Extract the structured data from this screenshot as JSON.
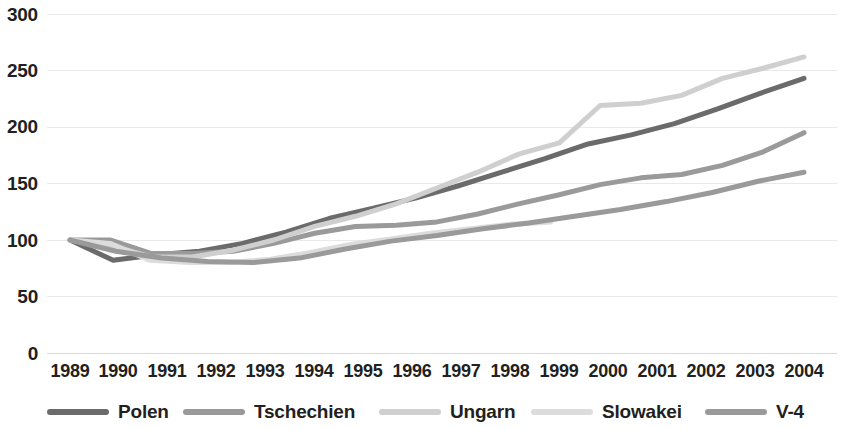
{
  "chart_data": {
    "type": "line",
    "title": "",
    "subtitle": "",
    "xlabel": "",
    "ylabel": "",
    "grid": true,
    "legend_position": "bottom",
    "categories": [
      "1989",
      "1990",
      "1991",
      "1992",
      "1993",
      "1994",
      "1995",
      "1996",
      "1997",
      "1998",
      "1999",
      "2000",
      "2001",
      "2002",
      "2003",
      "2004"
    ],
    "x": [
      1989,
      1990,
      1991,
      1992,
      1993,
      1994,
      1995,
      1996,
      1997,
      1998,
      1999,
      2000,
      2001,
      2002,
      2003,
      2004
    ],
    "ylim": [
      0,
      300
    ],
    "xlim": [
      1989,
      2004
    ],
    "yticks": [
      0,
      50,
      100,
      150,
      200,
      250,
      300
    ],
    "series": [
      {
        "name": "Polen",
        "color": "#595959",
        "values": [
          100,
          82,
          86,
          90,
          94,
          99,
          106,
          113,
          121,
          127,
          133,
          140,
          142,
          144,
          150,
          158
        ]
      },
      {
        "name": "Tschechien",
        "color": "#8c8c8c",
        "values": [
          100,
          99,
          88,
          88,
          88,
          91,
          97,
          101,
          100,
          99,
          100,
          104,
          107,
          109,
          113,
          118
        ]
      },
      {
        "name": "Ungarn",
        "color": "#c9c9c9",
        "values": [
          100,
          96,
          85,
          82,
          82,
          85,
          87,
          88,
          92,
          97,
          102,
          108,
          113,
          118,
          123,
          128
        ]
      },
      {
        "name": "Slowakei",
        "color": "#d8d8d8",
        "values": [
          100,
          97,
          82,
          80,
          80,
          84,
          89,
          95,
          101,
          105,
          108,
          111,
          116,
          119,
          124,
          130
        ]
      },
      {
        "name": "V-4",
        "color": "#a6a6a6",
        "values": [
          100,
          92,
          86,
          87,
          88,
          91,
          96,
          101,
          105,
          108,
          112,
          116,
          120,
          124,
          129,
          135
        ]
      }
    ],
    "plot_series": [
      {
        "name": "Polen",
        "color": "#6b6b6b",
        "width": 5,
        "values": [
          100,
          82,
          87,
          90,
          97,
          107,
          119,
          128,
          137,
          148,
          160,
          172,
          185,
          193,
          203,
          216,
          230,
          243
        ]
      },
      {
        "name": "Tschechien",
        "color": "#9a9a9a",
        "width": 5,
        "values": [
          100,
          100,
          88,
          88,
          90,
          97,
          106,
          112,
          113,
          116,
          123,
          132,
          140,
          149,
          155,
          158,
          166,
          178,
          195
        ]
      },
      {
        "name": "Ungarn",
        "color": "#cfcfcf",
        "width": 5,
        "values": [
          100,
          95,
          85,
          85,
          91,
          100,
          112,
          121,
          132,
          146,
          160,
          176,
          186,
          219,
          221,
          228,
          243,
          252,
          262
        ]
      },
      {
        "name": "Slowakei",
        "color": "#dcdcdc",
        "width": 5,
        "values": [
          100,
          97,
          82,
          80,
          80,
          83,
          89,
          96,
          101,
          106,
          110,
          114,
          116
        ]
      },
      {
        "name": "V-4",
        "color": "#9a9a9a",
        "width": 5,
        "values": [
          100,
          90,
          84,
          81,
          80,
          84,
          92,
          99,
          104,
          110,
          115,
          121,
          127,
          134,
          142,
          152,
          160
        ]
      }
    ]
  },
  "axes": {
    "y_ticks": [
      "300",
      "250",
      "200",
      "150",
      "100",
      "50",
      "0"
    ],
    "x_ticks": [
      "1989",
      "1990",
      "1991",
      "1992",
      "1993",
      "1994",
      "1995",
      "1996",
      "1997",
      "1998",
      "1999",
      "2000",
      "2001",
      "2002",
      "2003",
      "2004"
    ]
  },
  "legend": {
    "items": [
      {
        "label": "Polen",
        "color": "#6b6b6b"
      },
      {
        "label": "Tschechien",
        "color": "#9a9a9a"
      },
      {
        "label": "Ungarn",
        "color": "#cfcfcf"
      },
      {
        "label": "Slowakei",
        "color": "#dcdcdc"
      },
      {
        "label": "V-4",
        "color": "#9a9a9a"
      }
    ]
  },
  "colors": {
    "gridline": "#e9e9e9",
    "text": "#231f20",
    "background": "#ffffff"
  }
}
